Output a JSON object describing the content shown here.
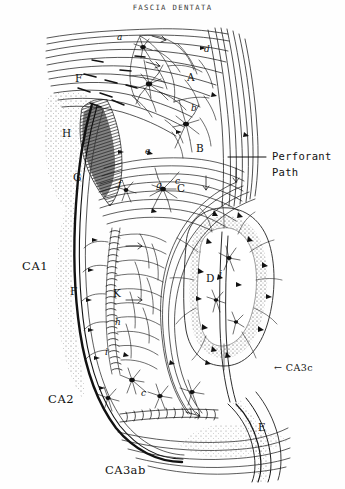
{
  "figure": {
    "title": "FASCIA DENTATA",
    "kind": "histological-line-drawing",
    "background_color": "#fefefe",
    "ink_color": "#101010"
  },
  "callouts": {
    "perforant_path": {
      "line1": "Perforant",
      "line2": "Path",
      "leader": {
        "x1": 262,
        "y1": 157,
        "x2": 228,
        "y2": 157
      }
    },
    "ca3c": {
      "arrow": "←",
      "label": "CA3c",
      "text": "← CA3c"
    }
  },
  "region_labels": [
    {
      "key": "ca1",
      "text": "CA1",
      "x": 22,
      "y": 261
    },
    {
      "key": "ca2",
      "text": "CA2",
      "x": 48,
      "y": 394
    },
    {
      "key": "ca3ab",
      "text": "CA3ab",
      "x": 105,
      "y": 465
    }
  ],
  "inner_labels": [
    {
      "key": "a",
      "text": "a",
      "x": 117,
      "y": 33,
      "style": "lower"
    },
    {
      "key": "d",
      "text": "d",
      "x": 204,
      "y": 45,
      "style": "lower"
    },
    {
      "key": "A",
      "text": "A",
      "x": 187,
      "y": 72,
      "style": "upper"
    },
    {
      "key": "b",
      "text": "b",
      "x": 191,
      "y": 104,
      "style": "lower"
    },
    {
      "key": "F",
      "text": "F",
      "x": 75,
      "y": 73,
      "style": "upper"
    },
    {
      "key": "H",
      "text": "H",
      "x": 62,
      "y": 128,
      "style": "upper"
    },
    {
      "key": "G",
      "text": "G",
      "x": 73,
      "y": 172,
      "style": "upper"
    },
    {
      "key": "e",
      "text": "e",
      "x": 145,
      "y": 147,
      "style": "lower"
    },
    {
      "key": "B",
      "text": "B",
      "x": 196,
      "y": 143,
      "style": "upper"
    },
    {
      "key": "f",
      "text": "f",
      "x": 118,
      "y": 180,
      "style": "lower"
    },
    {
      "key": "g",
      "text": "g",
      "x": 156,
      "y": 181,
      "style": "lower"
    },
    {
      "key": "c",
      "text": "c",
      "x": 175,
      "y": 177,
      "style": "lower"
    },
    {
      "key": "C",
      "text": "C",
      "x": 177,
      "y": 183,
      "style": "upper"
    },
    {
      "key": "F2",
      "text": "F",
      "x": 70,
      "y": 286,
      "style": "upper"
    },
    {
      "key": "K",
      "text": "K",
      "x": 113,
      "y": 288,
      "style": "upper"
    },
    {
      "key": "h",
      "text": "h",
      "x": 115,
      "y": 318,
      "style": "lower"
    },
    {
      "key": "i",
      "text": "i",
      "x": 105,
      "y": 348,
      "style": "lower"
    },
    {
      "key": "D",
      "text": "D",
      "x": 206,
      "y": 273,
      "style": "upper"
    },
    {
      "key": "j",
      "text": "j",
      "x": 219,
      "y": 270,
      "style": "lower"
    },
    {
      "key": "c2",
      "text": "c",
      "x": 141,
      "y": 389,
      "style": "lower"
    },
    {
      "key": "E",
      "text": "E",
      "x": 258,
      "y": 422,
      "style": "upper"
    }
  ],
  "anatomy_notes": {
    "alveus_fibers": "horizontal fiber bundles, upper-left",
    "perforant_tract": "oblique fiber tract, upper-right",
    "dentate_granule_layer": "stippled V-shaped band, center-right",
    "pyramidal_layer": "beaded arc descending left of center",
    "hilus": "open region marked D"
  }
}
